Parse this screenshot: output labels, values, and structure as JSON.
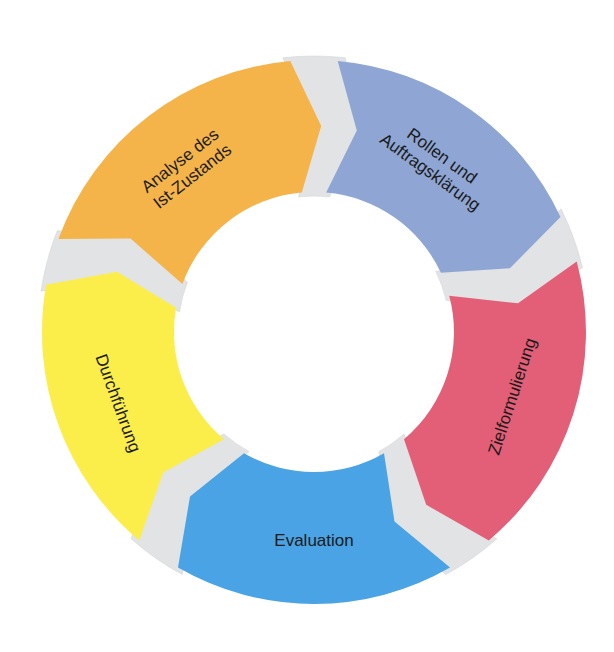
{
  "diagram": {
    "type": "cycle",
    "center": [
      314,
      332
    ],
    "outer_radius": 272,
    "inner_radius": 140,
    "separator_color": "#e2e3e5",
    "segments": [
      {
        "id": "analyse",
        "lines": [
          "Analyse des",
          "Ist-Zustands"
        ],
        "color": "#f4b44a",
        "start_deg": 195,
        "end_deg": 270,
        "label_deg": 232
      },
      {
        "id": "rollen",
        "lines": [
          "Rollen und",
          "Auftragsklärung"
        ],
        "color": "#8fa6d4",
        "start_deg": 270,
        "end_deg": 340,
        "label_deg": 306
      },
      {
        "id": "ziel",
        "lines": [
          "Zielformulierung"
        ],
        "color": "#e35f78",
        "start_deg": 340,
        "end_deg": 415,
        "label_deg": 18
      },
      {
        "id": "evaluation",
        "lines": [
          "Evaluation"
        ],
        "color": "#4aa3e4",
        "start_deg": 55,
        "end_deg": 125,
        "label_deg": 90
      },
      {
        "id": "durchfuehrung",
        "lines": [
          "Durchführung"
        ],
        "color": "#fbee4a",
        "start_deg": 125,
        "end_deg": 195,
        "label_deg": 160
      }
    ],
    "flow_direction": "clockwise"
  }
}
